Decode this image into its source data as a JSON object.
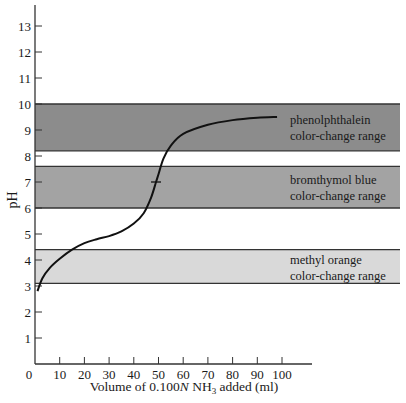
{
  "chart_data": {
    "type": "line",
    "title": "",
    "xlabel": "Volume of 0.100N NH3 added (ml)",
    "xlabel_parts": {
      "pre": "Volume of 0.100",
      "italic": "N",
      "mid": " NH",
      "sub": "3",
      "post": " added (ml)"
    },
    "ylabel": "pH",
    "xlim": [
      0,
      110
    ],
    "ylim": [
      0,
      14
    ],
    "x_ticks": [
      0,
      10,
      20,
      30,
      40,
      50,
      60,
      70,
      80,
      90,
      100
    ],
    "y_ticks": [
      1,
      2,
      3,
      4,
      5,
      6,
      7,
      8,
      9,
      10,
      11,
      12,
      13
    ],
    "grid": false,
    "series": [
      {
        "name": "Titration curve",
        "x": [
          1,
          3,
          6,
          10,
          15,
          20,
          25,
          30,
          35,
          40,
          44,
          47,
          49,
          50,
          52,
          55,
          60,
          70,
          80,
          90,
          98
        ],
        "y": [
          2.8,
          3.3,
          3.7,
          4.05,
          4.4,
          4.65,
          4.8,
          4.92,
          5.1,
          5.4,
          5.8,
          6.4,
          7.0,
          7.3,
          7.9,
          8.4,
          8.85,
          9.2,
          9.38,
          9.47,
          9.5
        ]
      }
    ],
    "equivalence_mark": {
      "x": 49,
      "y": 7.0
    },
    "bands": [
      {
        "name": "phenolphthalein",
        "label_line1": "phenolphthalein",
        "label_line2": "color-change range",
        "low": 8.2,
        "high": 10.0,
        "color": "#8c8c8c"
      },
      {
        "name": "bromthymol blue",
        "label_line1": "bromthymol blue",
        "label_line2": "color-change range",
        "low": 6.0,
        "high": 7.6,
        "color": "#a3a3a3"
      },
      {
        "name": "methyl orange",
        "label_line1": "methyl orange",
        "label_line2": "color-change range",
        "low": 3.1,
        "high": 4.4,
        "color": "#d9d9d9"
      }
    ]
  }
}
